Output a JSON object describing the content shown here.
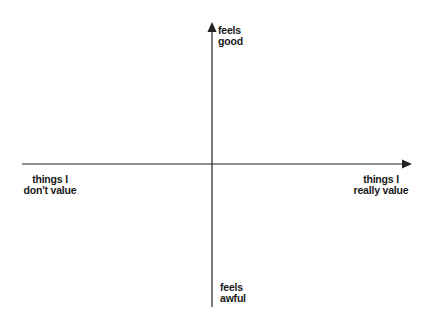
{
  "diagram": {
    "type": "quadrant",
    "axis_color": "#222222",
    "y_axis": {
      "top_label": [
        "feels",
        "good"
      ],
      "bottom_label": [
        "feels",
        "awful"
      ]
    },
    "x_axis": {
      "left_label": [
        "things I",
        "don't value"
      ],
      "right_label": [
        "things I",
        "really value"
      ]
    }
  }
}
